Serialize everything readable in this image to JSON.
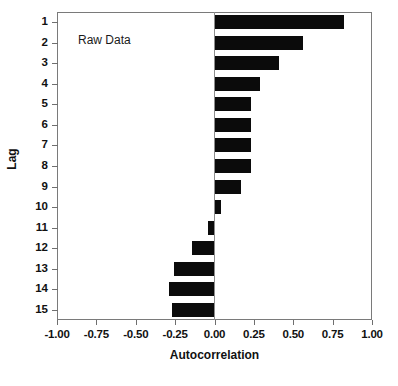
{
  "chart_data": {
    "type": "bar",
    "orientation": "horizontal",
    "title": "",
    "subtitle": "",
    "xlabel": "Autocorrelation",
    "ylabel": "Lag",
    "xlim": [
      -1.0,
      1.0
    ],
    "xticks": [
      -1.0,
      -0.75,
      -0.5,
      -0.25,
      0.0,
      0.25,
      0.5,
      0.75,
      1.0
    ],
    "xticklabels": [
      "-1.00",
      "-0.75",
      "-0.50",
      "-0.25",
      "0.00",
      "0.25",
      "0.50",
      "0.75",
      "1.00"
    ],
    "categories": [
      "1",
      "2",
      "3",
      "4",
      "5",
      "6",
      "7",
      "8",
      "9",
      "10",
      "11",
      "12",
      "13",
      "14",
      "15"
    ],
    "values": [
      0.82,
      0.56,
      0.41,
      0.29,
      0.23,
      0.23,
      0.23,
      0.23,
      0.17,
      0.04,
      -0.04,
      -0.14,
      -0.26,
      -0.29,
      -0.27
    ],
    "series": [
      {
        "name": "Raw Data",
        "values": [
          0.82,
          0.56,
          0.41,
          0.29,
          0.23,
          0.23,
          0.23,
          0.23,
          0.17,
          0.04,
          -0.04,
          -0.14,
          -0.26,
          -0.29,
          -0.27
        ]
      }
    ],
    "annotations": [
      {
        "text": "Raw Data",
        "x": -0.23,
        "y": 2
      }
    ],
    "grid": false,
    "legend": "none",
    "bar_color": "#0b0b0b",
    "frame_color": "#7a7a7a",
    "background_color": "#ffffff"
  },
  "axes": {
    "x_title": "Autocorrelation",
    "y_title": "Lag"
  },
  "annotation": {
    "label": "Raw Data"
  }
}
